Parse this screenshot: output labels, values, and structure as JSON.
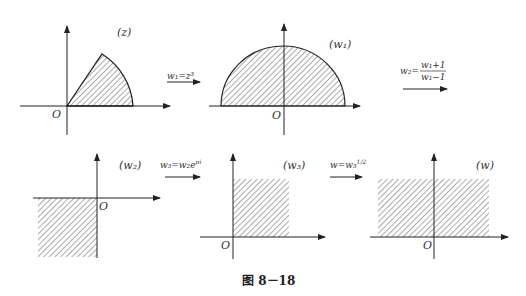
{
  "figure": {
    "caption": "图 8－18",
    "panels": [
      {
        "id": "z",
        "label": "(z)",
        "origin": "O",
        "region": "circular sector, angle 0 to ~π/3"
      },
      {
        "id": "w1",
        "label": "(w₁)",
        "origin": "O",
        "region": "upper half disk"
      },
      {
        "id": "w2",
        "label": "(w₂)",
        "origin": "O",
        "region": "third quadrant"
      },
      {
        "id": "w3",
        "label": "(w₃)",
        "origin": "O",
        "region": "vertical strip, first quadrant"
      },
      {
        "id": "w",
        "label": "(w)",
        "origin": "O",
        "region": "horizontal strip above real axis"
      }
    ],
    "maps": [
      {
        "id": "map1",
        "text": "w₁=z³"
      },
      {
        "id": "map2",
        "lhs": "w₂=",
        "num": "w₁+1",
        "den": "w₁−1"
      },
      {
        "id": "map3",
        "text": "w₃=w₂e^{πi}",
        "base": "w₃=w₂e",
        "sup": "πi"
      },
      {
        "id": "map4",
        "base": "w=w₃",
        "sup": "1/2"
      }
    ]
  },
  "colors": {
    "stroke": "#222222",
    "hatch": "#555555",
    "background": "#ffffff"
  }
}
